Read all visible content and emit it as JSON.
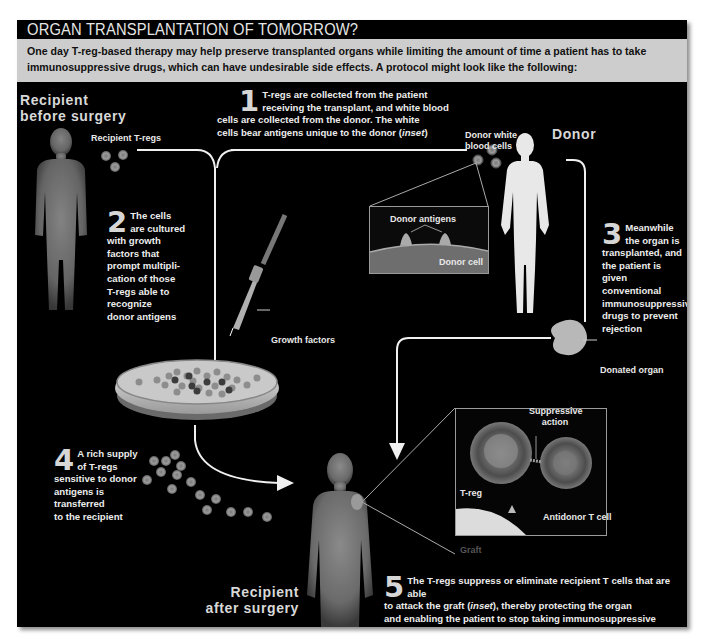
{
  "header": {
    "title": "ORGAN TRANSPLANTATION OF TOMORROW?",
    "intro": "One day T-reg-based therapy may help preserve transplanted organs while limiting the amount of time a patient has to take immunosuppressive drugs, which can have undesirable side effects. A protocol might look like the following:"
  },
  "figures": {
    "recipient_before": {
      "line1": "Recipient",
      "line2": "before surgery"
    },
    "donor": "Donor",
    "recipient_after": {
      "line1": "Recipient",
      "line2": "after surgery"
    }
  },
  "labels": {
    "recipient_tregs": "Recipient T-regs",
    "donor_wbc_1": "Donor white",
    "donor_wbc_2": "blood cells",
    "donor_antigens": "Donor antigens",
    "donor_cell": "Donor cell",
    "growth_factors": "Growth factors",
    "donated_organ": "Donated organ",
    "suppressive_1": "Suppressive",
    "suppressive_2": "action",
    "treg": "T-reg",
    "antidonor": "Antidonor T cell",
    "graft": "Graft"
  },
  "steps": [
    {
      "num": "1",
      "lines": [
        "T-regs are collected from the patient",
        "receiving the transplant, and white blood",
        "cells are collected from the donor. The white"
      ],
      "last_pre": "cells bear antigens unique to the donor (",
      "last_em": "inset",
      "last_post": ")"
    },
    {
      "num": "2",
      "lines": [
        "The cells",
        "are cultured",
        "with growth",
        "factors that",
        "prompt multipli-",
        "cation of those",
        "T-regs able to",
        "recognize",
        "donor antigens"
      ]
    },
    {
      "num": "3",
      "lines": [
        "Meanwhile",
        "the organ is",
        "transplanted, and",
        "the patient is given",
        "conventional",
        "immunosuppressive",
        "drugs to prevent",
        "rejection"
      ]
    },
    {
      "num": "4",
      "lines": [
        "A rich supply",
        "of T-regs",
        "sensitive to donor",
        "antigens is",
        "transferred",
        "to the recipient"
      ]
    },
    {
      "num": "5",
      "line1": "The T-regs suppress or eliminate recipient T cells that are able",
      "line2_pre": "to attack the graft (",
      "line2_em": "inset",
      "line2_post": "), thereby protecting the organ",
      "line3": "and enabling the patient to stop taking immunosuppressive drugs"
    }
  ]
}
